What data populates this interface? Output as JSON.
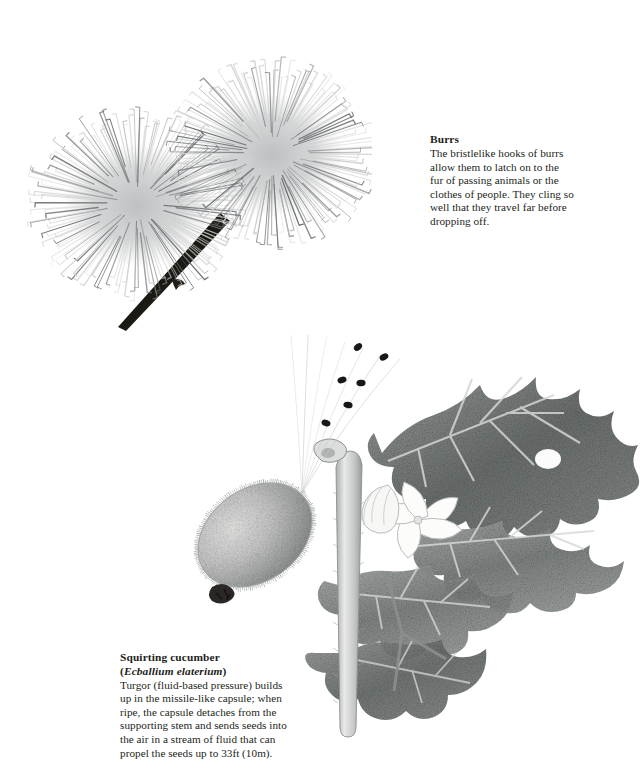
{
  "page": {
    "background_color": "#ffffff",
    "text_color": "#231f20",
    "kind": "botanical-illustration-page"
  },
  "captions": {
    "burrs": {
      "title": "Burrs",
      "body": "The bristlelike hooks of burrs\nallow them to latch on to the\nfur of passing animals or the\nclothes of people. They cling so\nwell that they travel far before\ndropping off."
    },
    "cucumber": {
      "title_common": "Squirting cucumber",
      "title_species_open": "(",
      "title_species": "Ecballium elaterium",
      "title_species_close": ")",
      "body": "Turgor (fluid-based pressure) builds\nup in the missile-like capsule; when\nripe, the capsule detaches from the\nsupporting stem and sends seeds into\nthe air in a stream of fluid that can\npropel the seeds up to 33ft (10m)."
    }
  },
  "illustrations": {
    "burrs": {
      "name": "burrs-illustration",
      "description": "Two spherical burdock seed heads covered in hooked bristles on a dark angled stem",
      "heads": [
        {
          "id": "burr-head-left",
          "cx": 115,
          "cy": 158,
          "rx": 97,
          "ry": 83,
          "bristle_count": 150
        },
        {
          "id": "burr-head-right",
          "cx": 250,
          "cy": 108,
          "rx": 92,
          "ry": 82,
          "bristle_count": 150
        }
      ],
      "stem": {
        "id": "burr-stem",
        "color": "#1d1b19"
      },
      "bristle_color_light": "#cfd0d1",
      "bristle_color_dark": "#6e7173"
    },
    "cucumber": {
      "name": "squirting-cucumber-illustration",
      "description": "Detached bristly fruit capsule ejecting a spray of seeds beside the empty curved stalk and a leafy vine with a pale flower",
      "capsule": {
        "id": "fruit-capsule",
        "cx": 105,
        "cy": 200,
        "rx": 62,
        "ry": 46,
        "rotation": -36
      },
      "scar": {
        "id": "capsule-detach-scar",
        "x": 63,
        "y": 255
      },
      "stalk": {
        "id": "supporting-stem",
        "tip_x": 191,
        "tip_y": 120
      },
      "seed_count": 6,
      "seeds": [
        {
          "x": 208,
          "y": 12
        },
        {
          "x": 234,
          "y": 22
        },
        {
          "x": 192,
          "y": 45
        },
        {
          "x": 211,
          "y": 48
        },
        {
          "x": 198,
          "y": 70
        },
        {
          "x": 176,
          "y": 88
        }
      ],
      "spray_line_count": 7,
      "flower": {
        "id": "cucumber-flower",
        "petals": 5,
        "cx": 268,
        "cy": 185
      },
      "leaf_color_mid": "#8d9190",
      "leaf_color_dark": "#5d6261",
      "leaf_color_light": "#c9cccb",
      "seed_color": "#1a1718"
    }
  }
}
